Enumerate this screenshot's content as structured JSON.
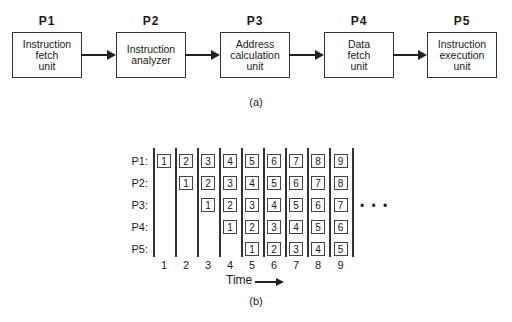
{
  "part_a": {
    "caption": "(a)",
    "stages": [
      {
        "id": "P1",
        "label": "Instruction\nfetch\nunit"
      },
      {
        "id": "P2",
        "label": "Instruction\nanalyzer"
      },
      {
        "id": "P3",
        "label": "Address\ncalculation\nunit"
      },
      {
        "id": "P4",
        "label": "Data\nfetch\nunit"
      },
      {
        "id": "P5",
        "label": "Instruction\nexecution\nunit"
      }
    ]
  },
  "part_b": {
    "caption": "(b)",
    "row_labels": [
      "P1:",
      "P2:",
      "P3:",
      "P4:",
      "P5:"
    ],
    "time_labels": [
      "1",
      "2",
      "3",
      "4",
      "5",
      "6",
      "7",
      "8",
      "9"
    ],
    "time_axis_label": "Time",
    "continuation": "• • •",
    "grid": [
      [
        "1",
        "2",
        "3",
        "4",
        "5",
        "6",
        "7",
        "8",
        "9"
      ],
      [
        "",
        "1",
        "2",
        "3",
        "4",
        "5",
        "6",
        "7",
        "8"
      ],
      [
        "",
        "",
        "1",
        "2",
        "3",
        "4",
        "5",
        "6",
        "7"
      ],
      [
        "",
        "",
        "",
        "1",
        "2",
        "3",
        "4",
        "5",
        "6"
      ],
      [
        "",
        "",
        "",
        "",
        "1",
        "2",
        "3",
        "4",
        "5"
      ]
    ]
  }
}
